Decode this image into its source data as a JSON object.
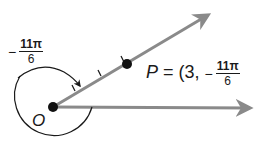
{
  "diagram": {
    "type": "polar-angle-diagram",
    "origin_label": "O",
    "point_label": "P",
    "point_coords": {
      "prefix": "P = (3,",
      "angle_sign": "−",
      "angle_numerator": "11π",
      "angle_denominator": "6"
    },
    "angle_label": {
      "sign": "−",
      "numerator": "11π",
      "denominator": "6"
    },
    "radius_ticks": 3,
    "colors": {
      "ray": "#8a8a8a",
      "ink": "#1a1a1a",
      "background": "#ffffff"
    }
  }
}
